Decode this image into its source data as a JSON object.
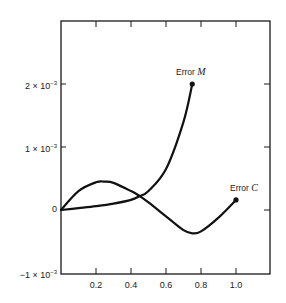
{
  "chart_data": {
    "type": "line",
    "title": "",
    "xlabel": "",
    "ylabel": "",
    "xlim": [
      0,
      1.2
    ],
    "ylim": [
      -0.001,
      0.003
    ],
    "grid": false,
    "legend": "none (direct curve labels)",
    "x_ticks": [
      0.2,
      0.4,
      0.6,
      0.8,
      1.0
    ],
    "x_tick_labels": [
      "0.2",
      "0.4",
      "0.6",
      "0.8",
      "1.0"
    ],
    "y_ticks": [
      -0.001,
      0,
      0.001,
      0.002
    ],
    "y_tick_labels": [
      {
        "mant": "−1 × 10",
        "exp": "−3"
      },
      {
        "mant": "0",
        "exp": ""
      },
      {
        "mant": "1 × 10",
        "exp": "−3"
      },
      {
        "mant": "2 × 10",
        "exp": "−3"
      }
    ],
    "series": [
      {
        "name": "Error M",
        "label_prefix": "Error ",
        "label_var": "M",
        "x": [
          0.0,
          0.1,
          0.2,
          0.3,
          0.4,
          0.45,
          0.5,
          0.6,
          0.7,
          0.75
        ],
        "y": [
          0.0,
          3e-05,
          6e-05,
          0.0001,
          0.00016,
          0.00022,
          0.0003,
          0.00065,
          0.0014,
          0.002
        ],
        "endpoint_marker": true
      },
      {
        "name": "Error C",
        "label_prefix": "Error ",
        "label_var": "C",
        "x": [
          0.0,
          0.1,
          0.2,
          0.25,
          0.3,
          0.4,
          0.45,
          0.5,
          0.6,
          0.7,
          0.75,
          0.8,
          0.9,
          1.0
        ],
        "y": [
          0.0,
          0.0003,
          0.00044,
          0.00045,
          0.00043,
          0.0003,
          0.00022,
          0.00012,
          -0.0001,
          -0.00032,
          -0.00037,
          -0.00034,
          -0.00012,
          0.00016
        ],
        "endpoint_marker": true
      }
    ]
  }
}
